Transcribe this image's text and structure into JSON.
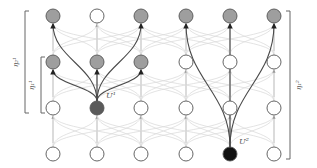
{
  "diagram": {
    "type": "layered-network",
    "columns_x": [
      53,
      97,
      141,
      186,
      230,
      274
    ],
    "rows_y": [
      16,
      62,
      108,
      154
    ],
    "node_radius": 7,
    "colors": {
      "background": "#ffffff",
      "empty_node_fill": "#ffffff",
      "node_stroke": "#555555",
      "reached_node_fill": "#9e9e9e",
      "source1_fill": "#5a5a5a",
      "source2_fill": "#111111",
      "faint_edge": "#dcdcdc",
      "highlight_edge": "#4a4a4a",
      "bracket": "#666666"
    },
    "sources": [
      {
        "id": "u1",
        "label": "U¹",
        "col": 1,
        "row": 2,
        "fill_key": "source1_fill",
        "targets": [
          [
            0,
            1
          ],
          [
            1,
            1
          ],
          [
            2,
            1
          ],
          [
            0,
            0
          ],
          [
            2,
            0
          ]
        ]
      },
      {
        "id": "u2",
        "label": "U²",
        "col": 4,
        "row": 3,
        "fill_key": "source2_fill",
        "targets": [
          [
            3,
            0
          ],
          [
            4,
            0
          ],
          [
            5,
            0
          ]
        ]
      }
    ],
    "reached_nodes": [
      [
        0,
        0
      ],
      [
        2,
        0
      ],
      [
        3,
        0
      ],
      [
        4,
        0
      ],
      [
        5,
        0
      ],
      [
        0,
        1
      ],
      [
        1,
        1
      ],
      [
        2,
        1
      ]
    ],
    "brackets": [
      {
        "id": "outer-left",
        "label": "η₂¹",
        "x": 25,
        "y1": 16,
        "y2": 108,
        "side": "left"
      },
      {
        "id": "inner-left",
        "label": "η₁¹",
        "x": 41,
        "y1": 62,
        "y2": 108,
        "side": "left"
      },
      {
        "id": "right",
        "label": "η₁²",
        "x": 290,
        "y1": 16,
        "y2": 154,
        "side": "right"
      }
    ]
  }
}
